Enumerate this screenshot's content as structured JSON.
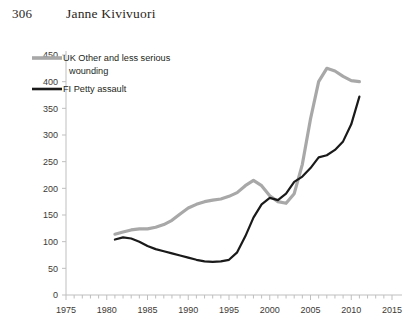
{
  "running_head": {
    "page_number": "306",
    "author": "Janne Kivivuori"
  },
  "legend": {
    "position": "top-left-inside",
    "entries": [
      {
        "label_line1": "UK Other and less serious",
        "label_line2": "wounding",
        "color": "#a8a8a8",
        "series_key": "uk_other_wounding"
      },
      {
        "label_line1": "FI Petty assault",
        "label_line2": "",
        "color": "#1a1a1a",
        "series_key": "fi_petty_assault"
      }
    ]
  },
  "axes": {
    "y_ticks": [
      "0",
      "50",
      "100",
      "150",
      "200",
      "250",
      "300",
      "350",
      "400",
      "450"
    ],
    "x_ticks": [
      "1975",
      "1980",
      "1985",
      "1990",
      "1995",
      "2000",
      "2005",
      "2010",
      "2015"
    ]
  },
  "chart_data": {
    "type": "line",
    "title": "",
    "subtitle": "",
    "xlabel": "",
    "ylabel": "",
    "xlim": [
      1975,
      2015
    ],
    "ylim": [
      0,
      450
    ],
    "y_tick_step": 50,
    "x_tick_step": 5,
    "x_minor_tick_step": 1,
    "grid": false,
    "legend_position": "top-left-inside",
    "series": [
      {
        "name": "UK Other and less serious wounding",
        "color": "#a8a8a8",
        "line_width": 3.2,
        "x": [
          1981,
          1982,
          1983,
          1984,
          1985,
          1986,
          1987,
          1988,
          1989,
          1990,
          1991,
          1992,
          1993,
          1994,
          1995,
          1996,
          1997,
          1998,
          1999,
          2000,
          2001,
          2002,
          2003,
          2004,
          2005,
          2006,
          2007,
          2008,
          2009,
          2010,
          2011
        ],
        "values": [
          114,
          118,
          122,
          124,
          124,
          127,
          132,
          140,
          152,
          163,
          170,
          175,
          178,
          180,
          185,
          192,
          205,
          215,
          205,
          186,
          175,
          172,
          190,
          245,
          330,
          400,
          425,
          420,
          410,
          402,
          400
        ]
      },
      {
        "name": "FI Petty assault",
        "color": "#1a1a1a",
        "line_width": 2.2,
        "x": [
          1981,
          1982,
          1983,
          1984,
          1985,
          1986,
          1987,
          1988,
          1989,
          1990,
          1991,
          1992,
          1993,
          1994,
          1995,
          1996,
          1997,
          1998,
          1999,
          2000,
          2001,
          2002,
          2003,
          2004,
          2005,
          2006,
          2007,
          2008,
          2009,
          2010,
          2011
        ],
        "values": [
          104,
          108,
          106,
          100,
          92,
          86,
          82,
          78,
          74,
          70,
          66,
          63,
          62,
          63,
          66,
          80,
          110,
          145,
          170,
          182,
          178,
          190,
          212,
          222,
          238,
          258,
          262,
          272,
          288,
          320,
          372
        ]
      }
    ]
  }
}
